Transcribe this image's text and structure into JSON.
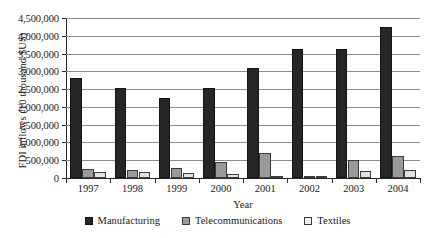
{
  "chart_data": {
    "type": "bar",
    "title": "",
    "xlabel": "Year",
    "ylabel": "FDI inflows (10 thousand $US)",
    "categories": [
      "1997",
      "1998",
      "1999",
      "2000",
      "2001",
      "2002",
      "2003",
      "2004"
    ],
    "ylim": [
      0,
      4500000
    ],
    "ytick_step": 500000,
    "ytick_labels": [
      "4,500,000",
      "4,000,000",
      "3,500,000",
      "3,000,000",
      "2,500,000",
      "2,000,000",
      "1,500,000",
      "1,000,000",
      "500,000",
      "0"
    ],
    "ytick_values": [
      4500000,
      4000000,
      3500000,
      3000000,
      2500000,
      2000000,
      1500000,
      1000000,
      500000,
      0
    ],
    "grid": true,
    "legend_position": "bottom",
    "series": [
      {
        "name": "Manufacturing",
        "color": "#262626",
        "values": [
          2800000,
          2530000,
          2240000,
          2530000,
          3100000,
          3630000,
          3620000,
          4250000
        ]
      },
      {
        "name": "Telecommunications",
        "color": "#9a9a9a",
        "values": [
          250000,
          220000,
          290000,
          460000,
          690000,
          40000,
          520000,
          620000
        ]
      },
      {
        "name": "Textiles",
        "color": "#e2e2e2",
        "values": [
          170000,
          160000,
          150000,
          100000,
          60000,
          20000,
          200000,
          220000
        ]
      }
    ]
  }
}
